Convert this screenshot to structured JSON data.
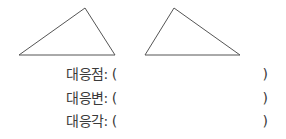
{
  "figures": {
    "left_triangle": {
      "points": "19,55 85,8 115,55"
    },
    "right_triangle": {
      "points": "145,55 174,8 240,55"
    },
    "stroke": "#555555"
  },
  "rows": [
    {
      "label": "대응점: (",
      "close": ")"
    },
    {
      "label": "대응변: (",
      "close": ")"
    },
    {
      "label": "대응각: (",
      "close": ")"
    }
  ]
}
